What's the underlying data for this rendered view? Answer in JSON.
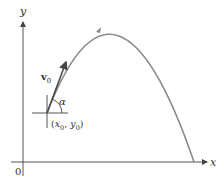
{
  "diagram": {
    "type": "projectile-trajectory",
    "axes": {
      "x_label": "x",
      "y_label": "y",
      "origin_label": "0"
    },
    "launch_point": {
      "label": "(x0, y0)",
      "label_parts": [
        "(",
        "x",
        "0",
        ", ",
        "y",
        "0",
        ")"
      ]
    },
    "velocity_vector": {
      "label": "v0",
      "symbol": "v",
      "subscript": "0"
    },
    "angle": {
      "label": "α"
    },
    "colors": {
      "axis": "#444444",
      "trajectory": "#888888",
      "vector": "#444444",
      "background": "#ffffff"
    }
  }
}
